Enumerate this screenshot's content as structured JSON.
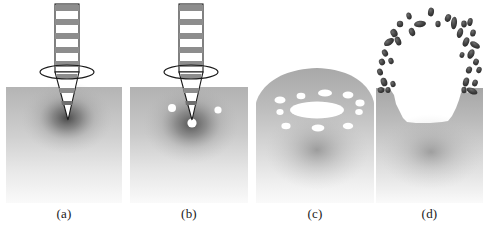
{
  "figure": {
    "panel_count": 4,
    "background_color": "#ffffff",
    "substrate_color": "#b9b9b9",
    "substrate_light_color": "#f2f2f2",
    "hotspot_color": "#4a4a4a",
    "void_color": "#ffffff",
    "ejecta_color": "#3c3c3c",
    "outline_color": "#1a1a1a",
    "beam_band_color": "#8d8d8d"
  },
  "panels": [
    {
      "id": "a",
      "caption": "(a)",
      "stage_name": "beam-focus-penetration",
      "description": "Focused segmented beam with lens ring penetrating substrate, dark absorption halo at tip",
      "has_beam": true,
      "has_lens_ring": true,
      "void_count": 0,
      "voids": [],
      "ejecta_count": 0,
      "surface_profile": "flat",
      "hotspot": {
        "cx": 61,
        "cy": 118,
        "rx": 46,
        "ry": 36
      },
      "cone_tip_y": 120
    },
    {
      "id": "b",
      "caption": "(b)",
      "stage_name": "bubble-nucleation",
      "description": "Same beam geometry; three small white cavities nucleate below the surface near the focal tip",
      "has_beam": true,
      "has_lens_ring": true,
      "void_count": 3,
      "voids": [
        {
          "cx": 42,
          "cy": 108,
          "rx": 4.0,
          "ry": 4.0
        },
        {
          "cx": 88,
          "cy": 110,
          "rx": 3.6,
          "ry": 3.6
        },
        {
          "cx": 62,
          "cy": 123,
          "rx": 4.6,
          "ry": 4.6
        }
      ],
      "ejecta_count": 0,
      "surface_profile": "flat",
      "hotspot": {
        "cx": 61,
        "cy": 124,
        "rx": 48,
        "ry": 40
      },
      "cone_tip_y": 120
    },
    {
      "id": "c",
      "caption": "(c)",
      "stage_name": "dome-swelling-void-growth",
      "description": "Beam removed; surface swells into a dome, a large elliptical cavity forms at the centre ringed by ten smaller voids",
      "has_beam": false,
      "has_lens_ring": false,
      "void_count": 11,
      "voids": [
        {
          "cx": 61,
          "cy": 110,
          "rx": 27.0,
          "ry": 8.5
        },
        {
          "cx": 24,
          "cy": 100,
          "rx": 5.5,
          "ry": 3.6
        },
        {
          "cx": 45,
          "cy": 96,
          "rx": 4.4,
          "ry": 3.2
        },
        {
          "cx": 69,
          "cy": 93,
          "rx": 7.0,
          "ry": 3.6
        },
        {
          "cx": 92,
          "cy": 95,
          "rx": 5.4,
          "ry": 3.4
        },
        {
          "cx": 104,
          "cy": 103,
          "rx": 4.6,
          "ry": 3.4
        },
        {
          "cx": 103,
          "cy": 112,
          "rx": 3.8,
          "ry": 3.0
        },
        {
          "cx": 24,
          "cy": 112,
          "rx": 3.6,
          "ry": 3.0
        },
        {
          "cx": 30,
          "cy": 126,
          "rx": 4.6,
          "ry": 3.2
        },
        {
          "cx": 62,
          "cy": 128,
          "rx": 6.4,
          "ry": 3.4
        },
        {
          "cx": 92,
          "cy": 126,
          "rx": 5.2,
          "ry": 3.2
        }
      ],
      "ejecta_count": 0,
      "surface_profile": "dome",
      "dome_peak_y": 68,
      "hotspot": {
        "cx": 61,
        "cy": 150,
        "rx": 52,
        "ry": 40
      }
    },
    {
      "id": "d",
      "caption": "(d)",
      "stage_name": "explosive-ejection-crater",
      "description": "Cavity ruptures; material ejects as a ring of dark droplets leaving a wide jagged crater",
      "has_beam": false,
      "has_lens_ring": false,
      "void_count": 0,
      "voids": [],
      "ejecta_count": 34,
      "ejecta": [
        {
          "cx": 55,
          "cy": 12,
          "rx": 3.0,
          "ry": 4.4,
          "rot": 10
        },
        {
          "cx": 33,
          "cy": 16,
          "rx": 2.6,
          "ry": 3.6,
          "rot": -15
        },
        {
          "cx": 72,
          "cy": 18,
          "rx": 3.0,
          "ry": 4.0,
          "rot": 20
        },
        {
          "cx": 44,
          "cy": 24,
          "rx": 6.0,
          "ry": 3.2,
          "rot": -8
        },
        {
          "cx": 62,
          "cy": 24,
          "rx": 2.6,
          "ry": 3.2,
          "rot": 0
        },
        {
          "cx": 78,
          "cy": 23,
          "rx": 3.0,
          "ry": 6.4,
          "rot": 6
        },
        {
          "cx": 88,
          "cy": 24,
          "rx": 2.8,
          "ry": 3.4,
          "rot": 0
        },
        {
          "cx": 24,
          "cy": 24,
          "rx": 3.2,
          "ry": 3.2,
          "rot": 0
        },
        {
          "cx": 94,
          "cy": 22,
          "rx": 2.6,
          "ry": 4.0,
          "rot": 14
        },
        {
          "cx": 36,
          "cy": 32,
          "rx": 3.0,
          "ry": 4.2,
          "rot": -20
        },
        {
          "cx": 18,
          "cy": 33,
          "rx": 3.4,
          "ry": 4.2,
          "rot": -26
        },
        {
          "cx": 84,
          "cy": 33,
          "rx": 3.0,
          "ry": 5.2,
          "rot": 16
        },
        {
          "cx": 97,
          "cy": 33,
          "rx": 2.8,
          "ry": 3.6,
          "rot": 12
        },
        {
          "cx": 13,
          "cy": 42,
          "rx": 5.6,
          "ry": 3.2,
          "rot": -34
        },
        {
          "cx": 22,
          "cy": 41,
          "rx": 3.0,
          "ry": 4.6,
          "rot": -22
        },
        {
          "cx": 90,
          "cy": 42,
          "rx": 3.0,
          "ry": 4.8,
          "rot": 22
        },
        {
          "cx": 99,
          "cy": 45,
          "rx": 5.4,
          "ry": 3.0,
          "rot": 30
        },
        {
          "cx": 9,
          "cy": 53,
          "rx": 2.8,
          "ry": 3.8,
          "rot": -30
        },
        {
          "cx": 95,
          "cy": 54,
          "rx": 3.2,
          "ry": 5.0,
          "rot": 26
        },
        {
          "cx": 86,
          "cy": 55,
          "rx": 2.4,
          "ry": 3.0,
          "rot": 18
        },
        {
          "cx": 6,
          "cy": 62,
          "rx": 3.0,
          "ry": 3.4,
          "rot": -28
        },
        {
          "cx": 15,
          "cy": 61,
          "rx": 2.6,
          "ry": 3.2,
          "rot": -20
        },
        {
          "cx": 100,
          "cy": 62,
          "rx": 2.8,
          "ry": 3.4,
          "rot": 24
        },
        {
          "cx": 4,
          "cy": 72,
          "rx": 2.8,
          "ry": 3.6,
          "rot": -24
        },
        {
          "cx": 93,
          "cy": 70,
          "rx": 3.0,
          "ry": 3.6,
          "rot": 20
        },
        {
          "cx": 103,
          "cy": 70,
          "rx": 2.6,
          "ry": 3.2,
          "rot": 22
        },
        {
          "cx": 8,
          "cy": 82,
          "rx": 3.2,
          "ry": 4.4,
          "rot": -18
        },
        {
          "cx": 17,
          "cy": 84,
          "rx": 2.6,
          "ry": 3.2,
          "rot": -14
        },
        {
          "cx": 90,
          "cy": 82,
          "rx": 3.0,
          "ry": 4.6,
          "rot": 16
        },
        {
          "cx": 99,
          "cy": 83,
          "rx": 2.8,
          "ry": 3.4,
          "rot": 18
        },
        {
          "cx": 5,
          "cy": 90,
          "rx": 3.4,
          "ry": 3.0,
          "rot": -8
        },
        {
          "cx": 96,
          "cy": 91,
          "rx": 5.8,
          "ry": 3.0,
          "rot": 24
        },
        {
          "cx": 12,
          "cy": 90,
          "rx": 2.6,
          "ry": 3.0,
          "rot": 0
        },
        {
          "cx": 88,
          "cy": 90,
          "rx": 2.6,
          "ry": 3.2,
          "rot": 0
        }
      ],
      "surface_profile": "crater",
      "crater_floor_y": 123,
      "crater_left_x": 22,
      "crater_right_x": 97,
      "hotspot": {
        "cx": 58,
        "cy": 150,
        "rx": 52,
        "ry": 38
      }
    }
  ],
  "beam": {
    "name": "segmented-laser-beam",
    "band_count": 5,
    "shaft_width": 24,
    "shaft_top_y": 4,
    "lens_ring": {
      "cx": 61,
      "cy": 72,
      "rx": 27,
      "ry": 7
    },
    "cone_top_y": 72,
    "cone_base_half_width": 12
  }
}
